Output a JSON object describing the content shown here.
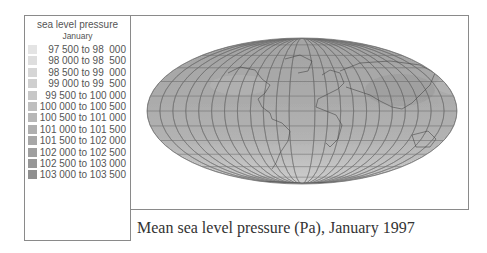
{
  "legend": {
    "title": "sea level pressure",
    "subtitle": "January",
    "entries": [
      {
        "label": "97 500 to 98  000",
        "color": "#e4e4e4"
      },
      {
        "label": "98 000 to 98  500",
        "color": "#dedede"
      },
      {
        "label": "98 500 to 99  000",
        "color": "#d6d6d6"
      },
      {
        "label": "99 000 to 99  500",
        "color": "#cfcfcf"
      },
      {
        "label": "99 500 to 100 000",
        "color": "#c7c7c7"
      },
      {
        "label": "100 000 to 100 500",
        "color": "#bfbfbf"
      },
      {
        "label": "100 500 to 101 000",
        "color": "#b7b7b7"
      },
      {
        "label": "101 000 to 101 500",
        "color": "#afafaf"
      },
      {
        "label": "101 500 to 102 000",
        "color": "#a7a7a7"
      },
      {
        "label": "102 000 to 102 500",
        "color": "#9f9f9f"
      },
      {
        "label": "102 500 to 103 000",
        "color": "#979797"
      },
      {
        "label": "103 000 to 103 500",
        "color": "#8f8f8f"
      }
    ]
  },
  "map": {
    "projection": "Mollweide",
    "variable": "sea level pressure",
    "units": "Pa",
    "month": "January",
    "year": "1997",
    "graticule": true
  },
  "caption": "Mean sea level pressure (Pa), January 1997"
}
